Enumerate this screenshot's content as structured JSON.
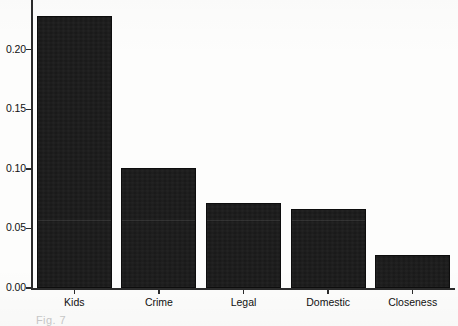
{
  "chart_data": {
    "type": "bar",
    "title": "",
    "subtitle": "",
    "xlabel": "",
    "ylabel": "",
    "categories": [
      "Kids",
      "Crime",
      "Legal",
      "Domestic",
      "Closeness"
    ],
    "values": [
      0.228,
      0.101,
      0.071,
      0.066,
      0.028
    ],
    "ylim": [
      0.0,
      0.235
    ],
    "yticks": [
      0.0,
      0.05,
      0.1,
      0.15,
      0.2
    ],
    "ytick_labels": [
      "0.00",
      "0.05",
      "0.10",
      "0.15",
      "0.20"
    ],
    "grid": false,
    "legend": null,
    "legend_position": "none",
    "bar_color": "#171717",
    "axis_color": "#2b2b2b",
    "text_color": "#111111"
  },
  "caption": {
    "text": "Fig. 7"
  }
}
